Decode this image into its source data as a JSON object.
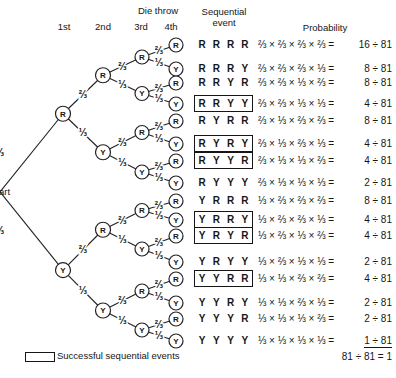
{
  "header": {
    "die_throw": "Die throw",
    "columns": [
      "1st",
      "2nd",
      "3rd",
      "4th"
    ],
    "sequential_event": [
      "Sequential",
      "event"
    ],
    "probability": "Probability"
  },
  "tree": {
    "start_label": "Start",
    "branch_labels": {
      "R": "⅔",
      "Y": "⅓"
    }
  },
  "rows": [
    {
      "sequence": [
        "R",
        "R",
        "R",
        "R"
      ],
      "boxed": false,
      "expression": "⅔ × ⅔ × ⅔ × ⅔ =",
      "result": "16 ÷ 81",
      "underlined": false
    },
    {
      "sequence": [
        "R",
        "R",
        "R",
        "Y"
      ],
      "boxed": false,
      "expression": "⅔ × ⅔ × ⅔ × ⅓ =",
      "result": "8 ÷ 81",
      "underlined": false
    },
    {
      "sequence": [
        "R",
        "R",
        "Y",
        "R"
      ],
      "boxed": false,
      "expression": "⅔ × ⅔ × ⅓ × ⅔ =",
      "result": "8 ÷ 81",
      "underlined": false
    },
    {
      "sequence": [
        "R",
        "R",
        "Y",
        "Y"
      ],
      "boxed": true,
      "expression": "⅔ × ⅔ × ⅓ × ⅓ =",
      "result": "4 ÷ 81",
      "underlined": false
    },
    {
      "sequence": [
        "R",
        "Y",
        "R",
        "R"
      ],
      "boxed": false,
      "expression": "⅔ × ⅓ × ⅔ × ⅔ =",
      "result": "8 ÷ 81",
      "underlined": false
    },
    {
      "sequence": [
        "R",
        "Y",
        "R",
        "Y"
      ],
      "boxed": true,
      "expression": "⅔ × ⅓ × ⅔ × ⅓ =",
      "result": "4 ÷ 81",
      "underlined": false
    },
    {
      "sequence": [
        "R",
        "Y",
        "Y",
        "R"
      ],
      "boxed": true,
      "expression": "⅔ × ⅓ × ⅓ × ⅔ =",
      "result": "4 ÷ 81",
      "underlined": false
    },
    {
      "sequence": [
        "R",
        "Y",
        "Y",
        "Y"
      ],
      "boxed": false,
      "expression": "⅔ × ⅓ × ⅓ × ⅓ =",
      "result": "2 ÷ 81",
      "underlined": false
    },
    {
      "sequence": [
        "Y",
        "R",
        "R",
        "R"
      ],
      "boxed": false,
      "expression": "⅓ × ⅔ × ⅔ × ⅔ =",
      "result": "8 ÷ 81",
      "underlined": false
    },
    {
      "sequence": [
        "Y",
        "R",
        "R",
        "Y"
      ],
      "boxed": true,
      "expression": "⅓ × ⅔ × ⅔ × ⅓ =",
      "result": "4 ÷ 81",
      "underlined": false
    },
    {
      "sequence": [
        "Y",
        "R",
        "Y",
        "R"
      ],
      "boxed": true,
      "expression": "⅓ × ⅔ × ⅓ × ⅔ =",
      "result": "4 ÷ 81",
      "underlined": false
    },
    {
      "sequence": [
        "Y",
        "R",
        "Y",
        "Y"
      ],
      "boxed": false,
      "expression": "⅓ × ⅔ × ⅓ × ⅓ =",
      "result": "2 ÷ 81",
      "underlined": false
    },
    {
      "sequence": [
        "Y",
        "Y",
        "R",
        "R"
      ],
      "boxed": true,
      "expression": "⅓ × ⅓ × ⅔ × ⅔ =",
      "result": "4 ÷ 81",
      "underlined": false
    },
    {
      "sequence": [
        "Y",
        "Y",
        "R",
        "Y"
      ],
      "boxed": false,
      "expression": "⅓ × ⅓ × ⅔ × ⅓ =",
      "result": "2 ÷ 81",
      "underlined": false
    },
    {
      "sequence": [
        "Y",
        "Y",
        "Y",
        "R"
      ],
      "boxed": false,
      "expression": "⅓ × ⅓ × ⅓ × ⅔ =",
      "result": "2 ÷ 81",
      "underlined": false
    },
    {
      "sequence": [
        "Y",
        "Y",
        "Y",
        "Y"
      ],
      "boxed": false,
      "expression": "⅓ × ⅓ × ⅓ × ⅓ =",
      "result": "1 ÷ 81",
      "underlined": true
    }
  ],
  "total": "81 ÷ 81 = 1",
  "legend": {
    "label": "Successful sequential events"
  }
}
